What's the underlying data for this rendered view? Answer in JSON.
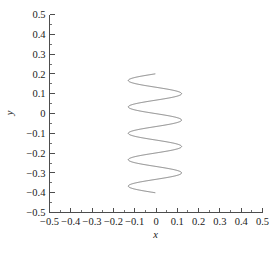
{
  "chart_data": {
    "type": "line",
    "title": "",
    "subtitle": "",
    "xlabel": "x",
    "ylabel": "y",
    "xlim": [
      -0.5,
      0.5
    ],
    "ylim": [
      -0.5,
      0.5
    ],
    "grid": false,
    "legend": null,
    "legend_position": "none",
    "annotations": [],
    "xticks": [
      -0.5,
      -0.4,
      -0.3,
      -0.2,
      -0.1,
      0,
      0.1,
      0.2,
      0.3,
      0.4,
      0.5
    ],
    "yticks": [
      -0.5,
      -0.4,
      -0.3,
      -0.2,
      -0.1,
      0,
      0.1,
      0.2,
      0.3,
      0.4,
      0.5
    ],
    "xtick_labels": [
      "−0.5",
      "−0.4",
      "−0.3",
      "−0.2",
      "−0.1",
      "0",
      "0.1",
      "0.2",
      "0.3",
      "0.4",
      "0.5"
    ],
    "ytick_labels": [
      "−0.5",
      "−0.4",
      "−0.3",
      "−0.2",
      "−0.1",
      "0",
      "0.1",
      "0.2",
      "0.3",
      "0.4",
      "0.5"
    ],
    "minor_tick_step": 0.05,
    "tick_direction": "in",
    "series": [
      {
        "name": "spiral-trajectory",
        "type": "parametric-spiral",
        "color": "#6b6b6b",
        "line_width": 0.85,
        "center_x": -0.005,
        "radius": 0.125,
        "y_start": 0.2,
        "y_end": -0.4,
        "turns": 4.5,
        "phase_deg": 90,
        "direction": "clockwise",
        "x": [
          0.0,
          0.046,
          0.086,
          0.114,
          0.124,
          0.116,
          0.09,
          0.051,
          0.005,
          -0.042,
          -0.082,
          -0.111,
          -0.123,
          -0.117,
          -0.093,
          -0.055,
          -0.009,
          0.038,
          0.079,
          0.109,
          0.123,
          0.119,
          0.096,
          0.059,
          0.014,
          -0.033,
          -0.075,
          -0.106,
          -0.122,
          -0.12,
          -0.099,
          -0.063,
          -0.019,
          0.029,
          0.071,
          0.104,
          0.121,
          0.121,
          0.102,
          0.067,
          0.024,
          -0.024,
          -0.067,
          -0.102,
          -0.121,
          -0.121,
          -0.104,
          -0.071,
          -0.029,
          0.019,
          0.063,
          0.099,
          0.12,
          0.122,
          0.106,
          0.075,
          0.033,
          -0.014,
          -0.059,
          -0.096,
          -0.119,
          -0.123,
          -0.109,
          -0.079,
          -0.038,
          0.009,
          0.055,
          0.093,
          0.117,
          0.123,
          0.111,
          0.082,
          0.042,
          -0.005,
          -0.051,
          -0.09,
          -0.116,
          -0.124,
          -0.114,
          -0.086,
          -0.046,
          0.0
        ],
        "y": [
          0.2,
          0.193,
          0.185,
          0.178,
          0.17,
          0.163,
          0.156,
          0.148,
          0.141,
          0.133,
          0.126,
          0.119,
          0.111,
          0.104,
          0.096,
          0.089,
          0.081,
          0.074,
          0.067,
          0.059,
          0.052,
          0.044,
          0.037,
          0.03,
          0.022,
          0.015,
          0.007,
          0.0,
          -0.007,
          -0.015,
          -0.022,
          -0.03,
          -0.037,
          -0.044,
          -0.052,
          -0.059,
          -0.067,
          -0.074,
          -0.081,
          -0.089,
          -0.096,
          -0.104,
          -0.111,
          -0.119,
          -0.126,
          -0.133,
          -0.141,
          -0.148,
          -0.156,
          -0.163,
          -0.17,
          -0.178,
          -0.185,
          -0.193,
          -0.2,
          -0.207,
          -0.215,
          -0.222,
          -0.23,
          -0.237,
          -0.244,
          -0.252,
          -0.259,
          -0.267,
          -0.274,
          -0.281,
          -0.289,
          -0.296,
          -0.304,
          -0.311,
          -0.318,
          -0.326,
          -0.333,
          -0.341,
          -0.348,
          -0.356,
          -0.363,
          -0.37,
          -0.378,
          -0.385,
          -0.393,
          -0.4
        ]
      }
    ]
  },
  "figure": {
    "background_color": "#ffffff",
    "axis_color": "#4d4d4d",
    "text_color": "#1a1a1a"
  }
}
